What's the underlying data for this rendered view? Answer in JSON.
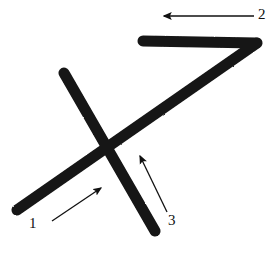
{
  "figure": {
    "background_color": "#ffffff",
    "stroke_color": "#141414",
    "annotation_color": "#111111",
    "width": 275,
    "height": 254,
    "strokes": [
      {
        "name": "horizontal-top-stroke",
        "description": "thick horizontal bar at top, drawn left-to-right",
        "x1": 143,
        "y1": 41,
        "x2": 256,
        "y2": 43,
        "thickness": 11
      },
      {
        "name": "long-diagonal-stroke",
        "description": "thick long diagonal from top-right corner down to bottom-left",
        "x1": 256,
        "y1": 43,
        "x2": 17,
        "y2": 210,
        "thickness": 11
      },
      {
        "name": "crossing-diagonal-stroke",
        "description": "thick diagonal from upper-left down to lower-right crossing the long diagonal",
        "x1": 64,
        "y1": 73,
        "x2": 155,
        "y2": 231,
        "thickness": 11
      }
    ],
    "intersection": {
      "name": "x-crossing-point",
      "x": 112,
      "y": 148
    },
    "annotations": [
      {
        "id": "1",
        "label": "1",
        "name": "annotation-arrow-1",
        "description": "thin arrow pointing up-right at the long diagonal stroke",
        "tail_x": 52,
        "tail_y": 221,
        "tip_x": 103,
        "tip_y": 186,
        "label_x": 29,
        "label_y": 216
      },
      {
        "id": "2",
        "label": "2",
        "name": "annotation-arrow-2",
        "description": "thin horizontal arrow pointing left above the top horizontal stroke",
        "tail_x": 254,
        "tail_y": 16,
        "tip_x": 160,
        "tip_y": 16,
        "label_x": 258,
        "label_y": 7
      },
      {
        "id": "3",
        "label": "3",
        "name": "annotation-arrow-3",
        "description": "thin arrow pointing up-left at the crossing diagonal stroke",
        "tail_x": 167,
        "tail_y": 212,
        "tip_x": 139,
        "tip_y": 152,
        "label_x": 168,
        "label_y": 213
      }
    ]
  }
}
